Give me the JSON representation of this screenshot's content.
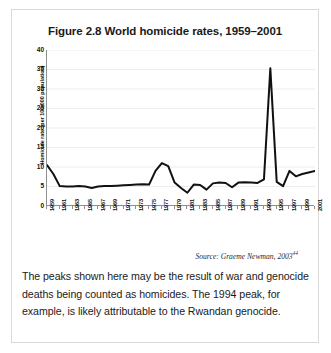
{
  "figure": {
    "title": "Figure 2.8 World homicide rates, 1959–2001",
    "source_text": "Source: Graeme Newman, 2003",
    "source_superscript": "44",
    "caption": "The peaks shown here may be the result of war and genocide deaths being counted as homicides. The 1994 peak, for example, is likely attributable to the Rwandan genocide."
  },
  "chart_data": {
    "type": "line",
    "title": "Figure 2.8 World homicide rates, 1959–2001",
    "xlabel": "",
    "ylabel": "Homicide rate (per 100,000 population)",
    "ylim": [
      0,
      40
    ],
    "yticks": [
      0,
      5,
      10,
      15,
      20,
      25,
      30,
      35,
      40
    ],
    "xlim": [
      1959,
      2001
    ],
    "grid": true,
    "legend": "none",
    "line_color": "#111111",
    "x": [
      1959,
      1960,
      1961,
      1962,
      1963,
      1964,
      1965,
      1966,
      1967,
      1968,
      1969,
      1970,
      1971,
      1972,
      1973,
      1974,
      1975,
      1976,
      1977,
      1978,
      1979,
      1980,
      1981,
      1982,
      1983,
      1984,
      1985,
      1986,
      1987,
      1988,
      1989,
      1990,
      1991,
      1992,
      1993,
      1994,
      1995,
      1996,
      1997,
      1998,
      1999,
      2000,
      2001
    ],
    "values": [
      10.5,
      8.2,
      5.1,
      5.0,
      5.0,
      5.1,
      5.0,
      4.6,
      5.0,
      5.1,
      5.1,
      5.2,
      5.3,
      5.4,
      5.5,
      5.6,
      5.5,
      9.0,
      11.0,
      10.2,
      6.0,
      4.6,
      3.4,
      5.5,
      5.4,
      4.2,
      5.8,
      6.0,
      5.9,
      4.8,
      6.0,
      6.1,
      6.0,
      5.9,
      6.8,
      35.3,
      6.2,
      5.1,
      9.0,
      7.6,
      8.2,
      8.6,
      9.0
    ],
    "xtick_labels": [
      "1959",
      "1961",
      "1963",
      "1965",
      "1967",
      "1969",
      "1971",
      "1973",
      "1975",
      "1977",
      "1979",
      "1981",
      "1983",
      "1985",
      "1987",
      "1989",
      "1991",
      "1993",
      "1995",
      "1997",
      "1999",
      "2001"
    ],
    "annotations": [
      "Source: Graeme Newman, 2003"
    ]
  }
}
